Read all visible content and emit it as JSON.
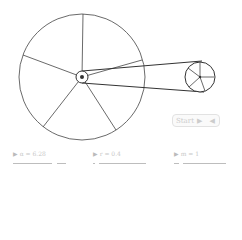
{
  "scene": {
    "big_wheel": {
      "cx": 82,
      "cy": 77,
      "r": 63,
      "spokes": 5
    },
    "small_wheel": {
      "cx": 200,
      "cy": 77,
      "r": 15,
      "spokes": 5
    },
    "stroke_color": "#333333"
  },
  "animate_button": {
    "label": "Start",
    "play_icon": "▶",
    "back_icon": "◀"
  },
  "controls": [
    {
      "label": "α = 6.28",
      "icon": "▶"
    },
    {
      "label": "r = 0.4",
      "icon": "▶"
    },
    {
      "label": "m = 1",
      "icon": "▶"
    }
  ]
}
